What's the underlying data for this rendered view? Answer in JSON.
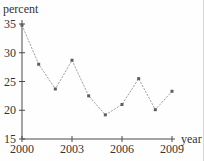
{
  "chart_data": {
    "type": "line",
    "title": "",
    "ylabel": "percent",
    "xlabel": "year",
    "x": [
      2000,
      2001,
      2002,
      2003,
      2004,
      2005,
      2006,
      2007,
      2008,
      2009
    ],
    "values": [
      34.8,
      28.0,
      23.7,
      28.7,
      22.5,
      19.2,
      21.0,
      25.5,
      20.1,
      23.3
    ],
    "ylim": [
      15,
      35
    ],
    "xlim": [
      2000,
      2009
    ],
    "yticks": [
      15,
      20,
      25,
      30,
      35
    ],
    "xticks": [
      2000,
      2003,
      2006,
      2009
    ],
    "grid": false,
    "legend": "none",
    "marker": "square",
    "line_style": "dotted",
    "colors": {
      "line": "#a3a3a3",
      "marker": "#5f5f5f",
      "axis": "#4a4a4a",
      "text": "#333333",
      "background": "#fefefe"
    }
  }
}
